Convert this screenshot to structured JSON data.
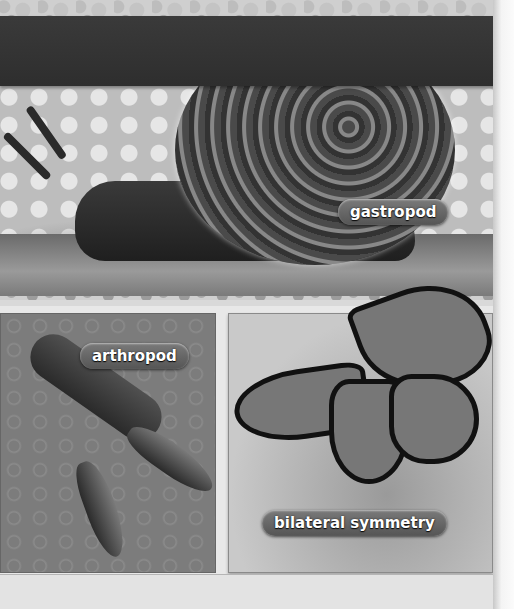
{
  "title_bar": {
    "text": ""
  },
  "photos": [
    {
      "id": "snail",
      "subject": "snail",
      "label": "gastropod"
    },
    {
      "id": "lobster",
      "subject": "lobster",
      "label": "arthropod"
    },
    {
      "id": "butterfly",
      "subject": "monarch butterfly",
      "label": "bilateral symmetry"
    }
  ],
  "colors": {
    "title_bar": "#333333",
    "label_bg": "#666666",
    "label_text": "#ffffff",
    "page_bg": "#e8e8e8"
  }
}
